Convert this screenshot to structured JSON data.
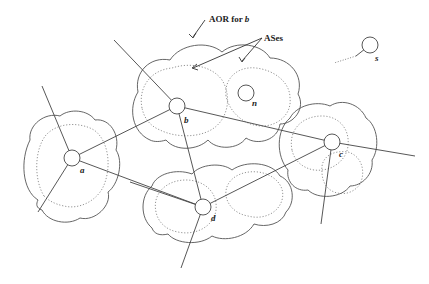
{
  "annotations": {
    "aor_prefix": "AOR for ",
    "aor_node": "b",
    "ases": "ASes"
  },
  "nodes": [
    {
      "id": "a",
      "label": "a"
    },
    {
      "id": "b",
      "label": "b"
    },
    {
      "id": "c",
      "label": "c"
    },
    {
      "id": "d",
      "label": "d"
    },
    {
      "id": "n",
      "label": "n"
    },
    {
      "id": "s",
      "label": "s"
    }
  ],
  "edges": [
    {
      "from": "a",
      "to": "b"
    },
    {
      "from": "a",
      "to": "d"
    },
    {
      "from": "b",
      "to": "d"
    },
    {
      "from": "b",
      "to": "c"
    },
    {
      "from": "d",
      "to": "c"
    }
  ]
}
